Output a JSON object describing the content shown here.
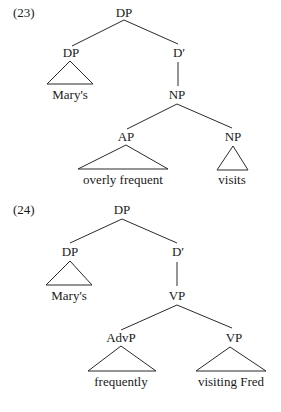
{
  "diagrams": [
    {
      "number": "(23)",
      "root": "DP",
      "spec": {
        "label": "DP",
        "leaf": "Mary's"
      },
      "bar": "D′",
      "head_phrase": {
        "label": "NP",
        "left": {
          "label": "AP",
          "leaf": "overly frequent"
        },
        "right": {
          "label": "NP",
          "leaf": "visits"
        }
      }
    },
    {
      "number": "(24)",
      "root": "DP",
      "spec": {
        "label": "DP",
        "leaf": "Mary's"
      },
      "bar": "D′",
      "head_phrase": {
        "label": "VP",
        "left": {
          "label": "AdvP",
          "leaf": "frequently"
        },
        "right": {
          "label": "VP",
          "leaf": "visiting Fred"
        }
      }
    }
  ]
}
